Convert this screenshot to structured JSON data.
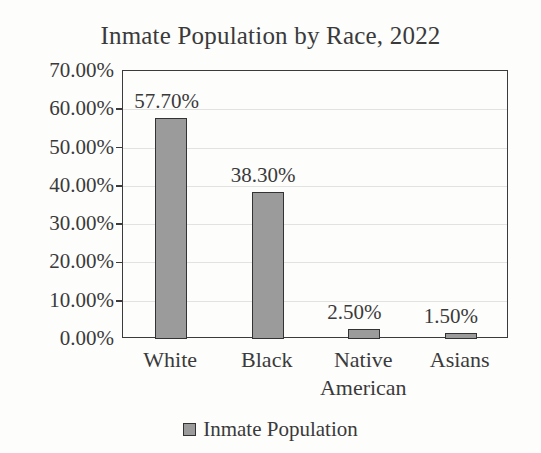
{
  "chart_data": {
    "type": "bar",
    "title": "Inmate Population by Race, 2022",
    "categories": [
      "White",
      "Black",
      "Native American",
      "Asians"
    ],
    "values": [
      57.7,
      38.3,
      2.5,
      1.5
    ],
    "value_labels": [
      "57.70%",
      "38.30%",
      "2.50%",
      "1.50%"
    ],
    "series": [
      {
        "name": "Inmate Population",
        "values": [
          57.7,
          38.3,
          2.5,
          1.5
        ]
      }
    ],
    "xlabel": "",
    "ylabel": "",
    "ylim": [
      0,
      70
    ],
    "y_tick_values": [
      70,
      60,
      50,
      40,
      30,
      20,
      10,
      0
    ],
    "y_tick_labels": [
      "70.00%",
      "60.00%",
      "50.00%",
      "40.00%",
      "30.00%",
      "20.00%",
      "10.00%",
      "0.00%"
    ],
    "grid": true,
    "legend_position": "bottom",
    "legend_entries": [
      "Inmate Population"
    ],
    "colors": {
      "bar_fill": "#9b9b9b",
      "bar_border": "#333333",
      "axis": "#3b3b3b",
      "gridline": "#e2e2e0",
      "text": "#3a3a3a",
      "background": "#fdfdfc"
    }
  },
  "legend": {
    "swatch_icon": "legend-swatch-square",
    "label": "Inmate Population"
  }
}
